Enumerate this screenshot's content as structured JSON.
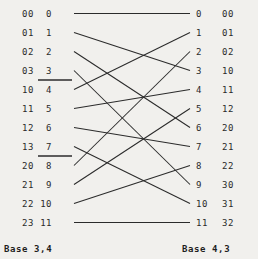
{
  "diagram": {
    "type": "bipartite-permutation-wiring",
    "title_left": "Base 3,4",
    "title_right": "Base 4,3",
    "rows": 12,
    "colors": {
      "background": "#f1f0ed",
      "ink": "#2b2b2b",
      "text": "#2a2a2a"
    },
    "left": {
      "codes": [
        "00",
        "01",
        "02",
        "03",
        "10",
        "11",
        "12",
        "13",
        "20",
        "21",
        "22",
        "23"
      ],
      "indices": [
        "0",
        "1",
        "2",
        "3",
        "4",
        "5",
        "6",
        "7",
        "8",
        "9",
        "10",
        "11"
      ],
      "group_dividers_after_row": [
        3,
        7
      ]
    },
    "right": {
      "indices": [
        "0",
        "1",
        "2",
        "3",
        "4",
        "5",
        "6",
        "7",
        "8",
        "9",
        "10",
        "11"
      ],
      "codes": [
        "00",
        "01",
        "02",
        "10",
        "11",
        "12",
        "20",
        "21",
        "22",
        "30",
        "31",
        "32"
      ]
    },
    "edges": [
      {
        "from": 0,
        "to": 0
      },
      {
        "from": 1,
        "to": 3
      },
      {
        "from": 2,
        "to": 6
      },
      {
        "from": 3,
        "to": 9
      },
      {
        "from": 4,
        "to": 1
      },
      {
        "from": 5,
        "to": 4
      },
      {
        "from": 6,
        "to": 7
      },
      {
        "from": 7,
        "to": 10
      },
      {
        "from": 8,
        "to": 2
      },
      {
        "from": 9,
        "to": 5
      },
      {
        "from": 10,
        "to": 8
      },
      {
        "from": 11,
        "to": 11
      }
    ]
  }
}
